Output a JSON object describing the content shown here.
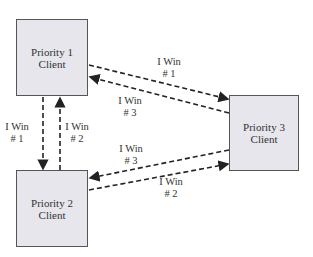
{
  "nodes": [
    {
      "id": "p1",
      "line1": "Priority 1",
      "line2": "Client"
    },
    {
      "id": "p2",
      "line1": "Priority 2",
      "line2": "Client"
    },
    {
      "id": "p3",
      "line1": "Priority 3",
      "line2": "Client"
    }
  ],
  "edges": [
    {
      "from": "p1",
      "to": "p3",
      "line1": "I Win",
      "line2": "# 1"
    },
    {
      "from": "p3",
      "to": "p1",
      "line1": "I Win",
      "line2": "# 3"
    },
    {
      "from": "p1",
      "to": "p2",
      "line1": "I Win",
      "line2": "# 1"
    },
    {
      "from": "p2",
      "to": "p1",
      "line1": "I Win",
      "line2": "# 2"
    },
    {
      "from": "p3",
      "to": "p2",
      "line1": "I Win",
      "line2": "# 3"
    },
    {
      "from": "p2",
      "to": "p3",
      "line1": "I Win",
      "line2": "# 2"
    }
  ],
  "colors": {
    "box_fill": "#e6e6ec",
    "stroke": "#222222"
  }
}
